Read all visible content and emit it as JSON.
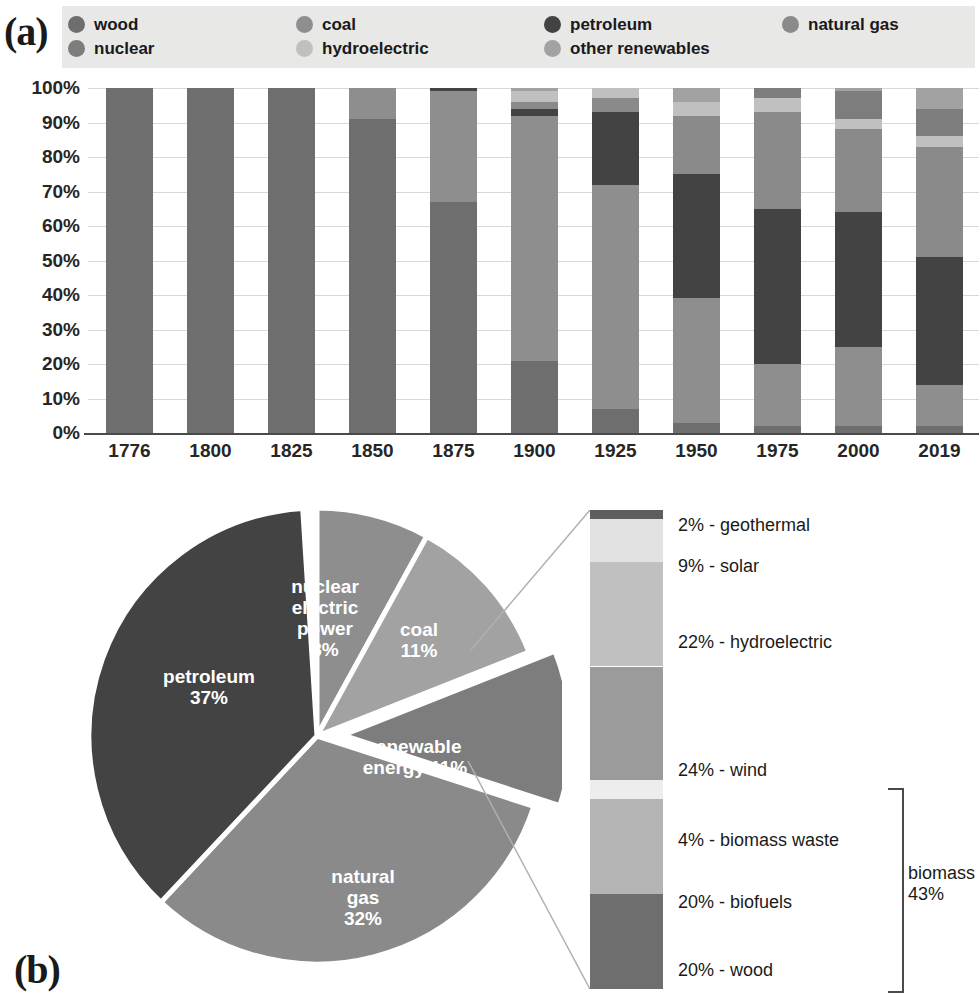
{
  "panels": {
    "a_letter": "(a)",
    "b_letter": "(b)"
  },
  "legend": {
    "items": [
      {
        "label": "wood",
        "color": "#6e6e6e",
        "col": 0,
        "row": 0
      },
      {
        "label": "nuclear",
        "color": "#7d7d7d",
        "col": 0,
        "row": 1
      },
      {
        "label": "coal",
        "color": "#8e8e8e",
        "col": 1,
        "row": 0
      },
      {
        "label": "hydroelectric",
        "color": "#c0c0c0",
        "col": 1,
        "row": 1
      },
      {
        "label": "petroleum",
        "color": "#434343",
        "col": 2,
        "row": 0
      },
      {
        "label": "other renewables",
        "color": "#a2a2a2",
        "col": 2,
        "row": 1
      },
      {
        "label": "natural gas",
        "color": "#8a8a8a",
        "col": 3,
        "row": 0
      }
    ]
  },
  "colors": {
    "wood": "#6e6e6e",
    "nuclear": "#7d7d7d",
    "coal": "#8e8e8e",
    "hydroelectric": "#c0c0c0",
    "petroleum": "#434343",
    "other_renewables": "#a2a2a2",
    "natural_gas": "#8a8a8a",
    "legend_bg": "#e8e8e6",
    "grid": "#d8d8d8",
    "axis": "#4a4a4a",
    "solar": "#e2e2e2",
    "geothermal": "#5e5e5e",
    "wind": "#9b9b9b",
    "biomass_waste": "#ededed",
    "biofuels": "#b4b4b4"
  },
  "chart_data": [
    {
      "type": "bar",
      "id": "panel-a-stacked-bar",
      "title": "",
      "xlabel": "",
      "ylabel": "",
      "ylim": [
        0,
        100
      ],
      "grid": true,
      "stacked": true,
      "normalized_percent": true,
      "legend_position": "top",
      "categories": [
        "1776",
        "1800",
        "1825",
        "1850",
        "1875",
        "1900",
        "1925",
        "1950",
        "1975",
        "2000",
        "2019"
      ],
      "ytick_labels": [
        "0%",
        "10%",
        "20%",
        "30%",
        "40%",
        "50%",
        "60%",
        "70%",
        "80%",
        "90%",
        "100%"
      ],
      "ytick_values": [
        0,
        10,
        20,
        30,
        40,
        50,
        60,
        70,
        80,
        90,
        100
      ],
      "series": [
        {
          "name": "wood",
          "values": [
            100,
            100,
            100,
            91,
            67,
            21,
            7,
            3,
            2,
            2,
            2
          ]
        },
        {
          "name": "coal",
          "values": [
            0,
            0,
            0,
            9,
            32,
            71,
            65,
            36,
            18,
            23,
            12
          ]
        },
        {
          "name": "petroleum",
          "values": [
            0,
            0,
            0,
            0,
            1,
            2,
            21,
            36,
            45,
            39,
            37
          ]
        },
        {
          "name": "natural gas",
          "values": [
            0,
            0,
            0,
            0,
            0,
            2,
            4,
            17,
            28,
            24,
            32
          ]
        },
        {
          "name": "hydroelectric",
          "values": [
            0,
            0,
            0,
            0,
            0,
            3,
            3,
            4,
            4,
            3,
            3
          ]
        },
        {
          "name": "nuclear",
          "values": [
            0,
            0,
            0,
            0,
            0,
            0,
            0,
            0,
            3,
            8,
            8
          ]
        },
        {
          "name": "other renewables",
          "values": [
            0,
            0,
            0,
            0,
            0,
            1,
            0,
            4,
            0,
            1,
            6
          ]
        }
      ]
    },
    {
      "type": "pie",
      "id": "panel-b-pie",
      "title": "",
      "labels": [
        "petroleum",
        "natural gas",
        "renewable energy",
        "coal",
        "nuclear electric power"
      ],
      "values": [
        37,
        32,
        11,
        11,
        8
      ],
      "exploded": [
        "renewable energy"
      ],
      "slice_labels": [
        {
          "name": "petroleum",
          "text": "petroleum\n37%"
        },
        {
          "name": "nuclear electric power",
          "text": "nuclear\nelectric\npower\n8%"
        },
        {
          "name": "coal",
          "text": "coal\n11%"
        },
        {
          "name": "renewable energy",
          "text": "renewable\nenergy 11%"
        },
        {
          "name": "natural gas",
          "text": "natural\ngas\n32%"
        }
      ]
    },
    {
      "type": "bar",
      "id": "panel-b-renewable-breakdown",
      "title": "",
      "stacked": true,
      "orientation": "vertical",
      "note": "breakdown of the renewable energy 11% slice",
      "categories": [
        "renewable energy"
      ],
      "segments_top_to_bottom": [
        {
          "label": "2% - geothermal",
          "name": "geothermal",
          "value": 2
        },
        {
          "label": "9% - solar",
          "name": "solar",
          "value": 9
        },
        {
          "label": "22% - hydroelectric",
          "name": "hydroelectric",
          "value": 22
        },
        {
          "label": "24% - wind",
          "name": "wind",
          "value": 24
        },
        {
          "label": "4% - biomass waste",
          "name": "biomass waste",
          "value": 4
        },
        {
          "label": "20% - biofuels",
          "name": "biofuels",
          "value": 20
        },
        {
          "label": "20% - wood",
          "name": "wood",
          "value": 20
        }
      ],
      "annotations": [
        {
          "name": "biomass-bracket",
          "text": "biomass\n43%",
          "covers": [
            "biomass waste",
            "biofuels",
            "wood"
          ],
          "value": 43
        }
      ]
    }
  ]
}
